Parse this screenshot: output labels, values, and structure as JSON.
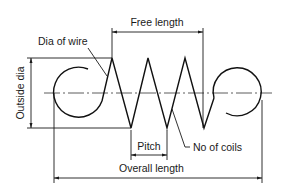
{
  "diagram": {
    "type": "compression-spring-dimensions",
    "labels": {
      "free_length": "Free length",
      "dia_of_wire": "Dia of wire",
      "outside_dia": "Outside dia",
      "pitch": "Pitch",
      "no_of_coils": "No of coils",
      "overall_length": "Overall length"
    },
    "colors": {
      "line": "#1a1a1a",
      "background": "#ffffff"
    }
  }
}
